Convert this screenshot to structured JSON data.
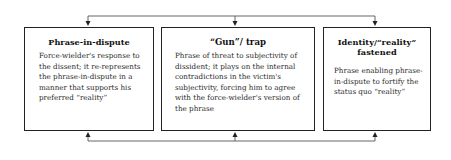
{
  "diagram": {
    "boxes": [
      {
        "title": "Phrase-in-dispute",
        "body": "Force-wielder's response to the dissent; it re-represents the phrase-in-dispute in a manner that supports his preferred “reality”"
      },
      {
        "title": "“Gun”/ trap",
        "body": "Phrase of threat to subjectivity of dissident; it plays on the internal contradictions in the victim's subjectivity, forcing him to agree with the force-wielder's version of the phrase"
      },
      {
        "title": "Identity/“reality” fastened",
        "body": "Phrase enabling phrase-in-dispute to fortify the status quo “reality”"
      }
    ],
    "connectors": {
      "top": "line linking all three boxes with downward arrows into each box",
      "bottom": "line linking all three boxes with upward arrows into each box"
    },
    "colors": {
      "line": "#555555",
      "border": "#222222",
      "text": "#1a1a1a"
    }
  }
}
